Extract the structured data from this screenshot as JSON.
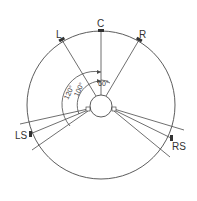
{
  "diagram": {
    "speakers": [
      {
        "id": "L",
        "label": "L"
      },
      {
        "id": "C",
        "label": "C"
      },
      {
        "id": "R",
        "label": "R"
      },
      {
        "id": "LS",
        "label": "LS"
      },
      {
        "id": "RS",
        "label": "RS"
      }
    ],
    "angles": [
      {
        "label": "60°"
      },
      {
        "label": "100°"
      },
      {
        "label": "120°"
      }
    ],
    "colors": {
      "line": "#4a4a4a",
      "background": "#ffffff"
    }
  }
}
